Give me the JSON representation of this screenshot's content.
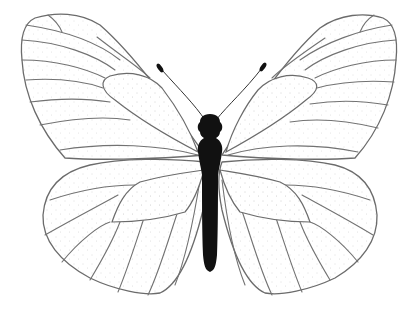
{
  "illustration": {
    "subject": "butterfly",
    "style": "black and white line art with stippling",
    "parts": {
      "left_forewing": "left-forewing",
      "right_forewing": "right-forewing",
      "left_hindwing": "left-hindwing",
      "right_hindwing": "right-hindwing",
      "body": "black-body",
      "antennae": "antennae"
    },
    "colors": {
      "background": "#ffffff",
      "outline": "#6b6b6b",
      "body": "#111111"
    }
  }
}
